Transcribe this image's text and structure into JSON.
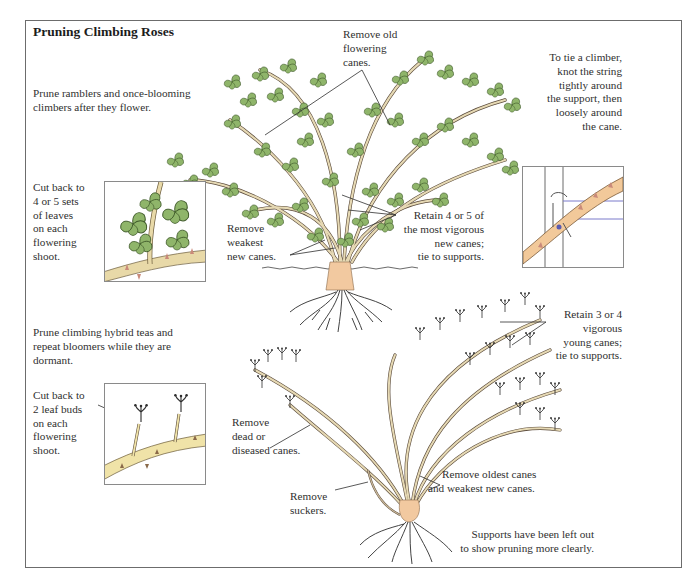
{
  "title": "Pruning Climbing Roses",
  "colors": {
    "frame": "#6c6c6c",
    "leaf": "#8fb56a",
    "leaf_dark": "#3f5a2a",
    "cane": "#e6d9b4",
    "cane_outline": "#5a4a3a",
    "root_base": "#f2c9a0",
    "text": "#303030"
  },
  "section_ramblers": {
    "intro": "Prune ramblers and once-blooming climbers after they flower.",
    "inset_caption": "Cut back to 4 or 5 sets of leaves on each flowering shoot.",
    "inset_caption_lines": [
      "Cut back to",
      "4 or 5 sets",
      "of leaves",
      "on each",
      "flowering",
      "shoot."
    ],
    "callouts": {
      "remove_old": [
        "Remove old",
        "flowering",
        "canes."
      ],
      "remove_weakest": [
        "Remove",
        "weakest",
        "new canes."
      ],
      "retain": [
        "Retain 4 or 5 of",
        "the most vigorous",
        "new canes;",
        "tie to supports."
      ]
    },
    "tie_note": [
      "To tie a climber,",
      "knot the string",
      "tightly around",
      "the support, then",
      "loosely around",
      "the cane."
    ]
  },
  "section_hybrid_teas": {
    "intro": [
      "Prune climbing hybrid teas and",
      "repeat bloomers while they are",
      "dormant."
    ],
    "inset_caption_lines": [
      "Cut back to",
      "2 leaf buds",
      "on each",
      "flowering",
      "shoot."
    ],
    "callouts": {
      "retain": [
        "Retain 3 or 4",
        "vigorous",
        "young canes;",
        "tie to supports."
      ],
      "remove_dead": [
        "Remove",
        "dead or",
        "diseased canes."
      ],
      "remove_oldest": [
        "Remove oldest canes",
        "and weakest new canes."
      ],
      "remove_suckers": [
        "Remove",
        "suckers."
      ]
    },
    "footnote": [
      "Supports have been left out",
      "to show pruning more clearly."
    ]
  }
}
